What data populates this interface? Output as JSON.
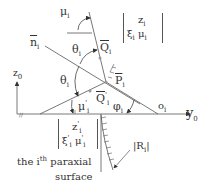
{
  "diagram": {
    "type": "paraxial ray geometry",
    "labels": {
      "mu_i": "μ",
      "mu_i_sub": "i",
      "theta_top": "θ",
      "theta_top_sub": "i",
      "theta_left": "θ",
      "theta_left_sub": "i",
      "Q_i": "Q",
      "Q_i_sub": "i",
      "P_i": "P",
      "P_i_sub": "i",
      "Q_i_prime": "Q",
      "Q_i_prime_sub": "i",
      "Q_i_prime_sup": "'",
      "mu_i_prime": "μ",
      "mu_i_prime_sub": "i",
      "mu_i_prime_sup": "'",
      "phi_i": "φ",
      "phi_i_sub": "i",
      "o_i": "o",
      "o_i_sub": "i",
      "n_i": "n",
      "n_i_sub": "i",
      "z0": "z",
      "z0_sub": "0",
      "y0": "y",
      "y0_sub": "0",
      "R_i": "|R",
      "R_i_sub": "i",
      "R_i_end": "|",
      "top_vector_row1": "z",
      "top_vector_row1_sub": "i",
      "top_vector_row2": "ξ",
      "top_vector_row2_sub": "i",
      "top_vector_row2b": "μ",
      "top_vector_row2b_sub": "i",
      "bottom_vector_row1": "z",
      "bottom_vector_row1_sub": "i",
      "bottom_vector_row2": "ξ",
      "bottom_vector_row2_sub": "i",
      "bottom_vector_row2b": "μ",
      "bottom_vector_row2b_sub": "i",
      "caption_line1_a": "the i",
      "caption_line1_sup": "th",
      "caption_line1_b": "paraxial",
      "caption_line2": "surface"
    },
    "colors": {
      "line": "#555555",
      "text": "#333333",
      "point": "#999999"
    }
  }
}
